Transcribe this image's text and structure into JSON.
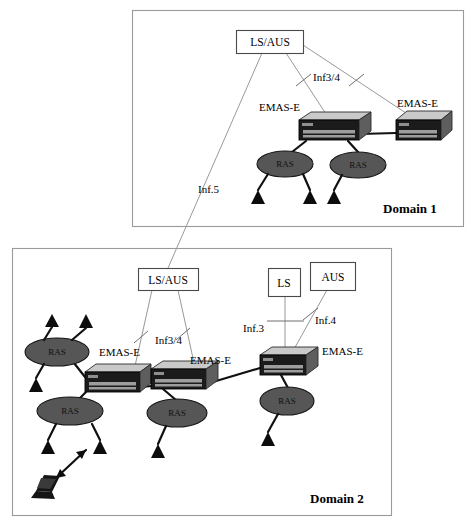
{
  "figure": {
    "background": "#ffffff",
    "width": 471,
    "height": 526
  },
  "colors": {
    "frame_stroke": "#9a9a9a",
    "thin_link": "#8d8d8d",
    "thick_link": "#111111",
    "device_top": "#c9c9c9",
    "device_front": "#1b1b1b",
    "ras_fill": "#565656",
    "terminal": "#0d0d0d",
    "text": "#000000"
  },
  "domain1": {
    "label": "Domain 1",
    "frame": {
      "x": 132,
      "y": 10,
      "w": 332,
      "h": 217
    },
    "boxes": [
      {
        "id": "d1-lsaus",
        "label": "LS/AUS",
        "x": 236,
        "y": 30,
        "w": 67,
        "h": 23
      }
    ],
    "devices": [
      {
        "id": "d1-emas-left",
        "label": "EMAS-E",
        "label_x": 259,
        "label_y": 111,
        "x": 299,
        "y": 113,
        "w": 60,
        "h": 21
      },
      {
        "id": "d1-emas-right",
        "label": "EMAS-E",
        "label_x": 399,
        "label_y": 107,
        "x": 395,
        "y": 112,
        "w": 57,
        "h": 20
      }
    ],
    "ras_nodes": [
      {
        "id": "d1-ras-left",
        "label": "RAS",
        "cx": 285,
        "cy": 163,
        "rx": 28,
        "ry": 13
      },
      {
        "id": "d1-ras-right",
        "label": "RAS",
        "cx": 358,
        "cy": 164,
        "rx": 28,
        "ry": 13
      }
    ],
    "link_labels": [
      {
        "id": "d1-inf34",
        "text": "Inf3/4",
        "x": 313,
        "y": 81
      },
      {
        "id": "d1-inf5",
        "text": "Inf.5",
        "x": 198,
        "y": 193
      }
    ]
  },
  "domain2": {
    "label": "Domain 2",
    "frame": {
      "x": 12,
      "y": 248,
      "w": 380,
      "h": 268
    },
    "boxes": [
      {
        "id": "d2-lsaus",
        "label": "LS/AUS",
        "x": 138,
        "y": 268,
        "w": 60,
        "h": 22
      },
      {
        "id": "d2-ls",
        "label": "LS",
        "x": 268,
        "y": 268,
        "w": 32,
        "h": 28
      },
      {
        "id": "d2-aus",
        "label": "AUS",
        "x": 310,
        "y": 262,
        "w": 45,
        "h": 28
      }
    ],
    "devices": [
      {
        "id": "d2-emas-1",
        "label": "EMAS-E",
        "label_x": 99,
        "label_y": 356,
        "x": 85,
        "y": 365,
        "w": 55,
        "h": 20
      },
      {
        "id": "d2-emas-2",
        "label": "EMAS-E",
        "label_x": 190,
        "label_y": 364,
        "x": 151,
        "y": 362,
        "w": 55,
        "h": 20
      },
      {
        "id": "d2-emas-3",
        "label": "EMAS-E",
        "label_x": 320,
        "label_y": 355,
        "x": 260,
        "y": 348,
        "w": 58,
        "h": 20
      }
    ],
    "ras_nodes": [
      {
        "id": "d2-ras-a",
        "label": "RAS",
        "cx": 57,
        "cy": 352,
        "rx": 32,
        "ry": 14
      },
      {
        "id": "d2-ras-b",
        "label": "RAS",
        "cx": 70,
        "cy": 411,
        "rx": 33,
        "ry": 14
      },
      {
        "id": "d2-ras-c",
        "label": "RAS",
        "cx": 177,
        "cy": 413,
        "rx": 30,
        "ry": 14
      },
      {
        "id": "d2-ras-d",
        "label": "RAS",
        "cx": 287,
        "cy": 401,
        "rx": 27,
        "ry": 14
      }
    ],
    "link_labels": [
      {
        "id": "d2-inf34",
        "text": "Inf3/4",
        "x": 155,
        "y": 341
      },
      {
        "id": "d2-inf3",
        "text": "Inf.3",
        "x": 243,
        "y": 329
      },
      {
        "id": "d2-inf4",
        "text": "Inf.4",
        "x": 313,
        "y": 323
      }
    ],
    "laptop": {
      "id": "d2-laptop",
      "x": 33,
      "y": 478,
      "w": 26,
      "h": 20
    },
    "wireless_arrow": {
      "id": "d2-wireless-link",
      "from_x": 53,
      "from_y": 482,
      "to_x": 88,
      "to_y": 448
    }
  },
  "interdomain_link": {
    "id": "inter-domain-link",
    "label": "Inf.5",
    "from": "d1-lsaus",
    "to": "d2-lsaus"
  }
}
